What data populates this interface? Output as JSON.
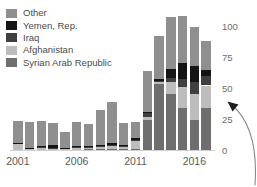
{
  "chart_data": {
    "type": "bar",
    "subtype": "stacked",
    "title": "",
    "xlabel": "",
    "ylabel": "",
    "ylim": [
      0,
      108
    ],
    "yticks": [
      0,
      25,
      50,
      75,
      100
    ],
    "grid": false,
    "legend_position": "top-left",
    "categories": [
      "2001",
      "2002",
      "2003",
      "2004",
      "2005",
      "2006",
      "2007",
      "2008",
      "2009",
      "2010",
      "2011",
      "2012",
      "2013",
      "2014",
      "2015",
      "2016",
      "2017"
    ],
    "xtick_labels": [
      "2001",
      "2006",
      "2011",
      "2016"
    ],
    "xtick_categories": [
      "2001",
      "2006",
      "2011",
      "2016"
    ],
    "series": [
      {
        "name": "Syrian Arab Republic",
        "color": "#6e6e6e",
        "values": [
          0.4,
          0.3,
          0.3,
          0.3,
          0.3,
          0.4,
          0.5,
          0.6,
          0.6,
          0.6,
          1.0,
          24.0,
          53.0,
          45.0,
          34.0,
          24.5,
          34.0
        ]
      },
      {
        "name": "Afghanistan",
        "color": "#bdbdbd",
        "values": [
          4.5,
          0.5,
          1.0,
          1.0,
          0.5,
          1.0,
          1.0,
          1.5,
          2.5,
          1.5,
          6.0,
          3.0,
          1.5,
          10.0,
          17.0,
          21.0,
          18.0
        ]
      },
      {
        "name": "Iraq",
        "color": "#3f3f3f",
        "values": [
          0.5,
          0.5,
          1.5,
          0.5,
          0.5,
          1.5,
          1.0,
          0.8,
          0.8,
          0.8,
          1.0,
          3.0,
          1.5,
          3.0,
          6.0,
          9.0,
          7.5
        ]
      },
      {
        "name": "Yemen, Rep.",
        "color": "#141414",
        "values": [
          0.3,
          0.3,
          0.3,
          2.0,
          0.4,
          0.5,
          1.0,
          1.5,
          1.5,
          1.0,
          1.5,
          1.0,
          1.2,
          7.0,
          13.0,
          13.0,
          5.0
        ]
      },
      {
        "name": "Other",
        "color": "#8f8f8f",
        "values": [
          18.0,
          21.0,
          20.5,
          18.0,
          13.0,
          19.0,
          17.5,
          27.5,
          33.5,
          18.0,
          13.0,
          33.0,
          34.5,
          42.0,
          38.0,
          32.0,
          23.0
        ]
      }
    ]
  },
  "legend": {
    "items": [
      {
        "label": "Other",
        "color": "#8f8f8f"
      },
      {
        "label": "Yemen, Rep.",
        "color": "#141414"
      },
      {
        "label": "Iraq",
        "color": "#3f3f3f"
      },
      {
        "label": "Afghanistan",
        "color": "#bdbdbd"
      },
      {
        "label": "Syrian Arab Republic",
        "color": "#6e6e6e"
      }
    ]
  },
  "annotation": {
    "arrow_name": "curved-callout-arrow",
    "color": "#8a8a8a"
  }
}
